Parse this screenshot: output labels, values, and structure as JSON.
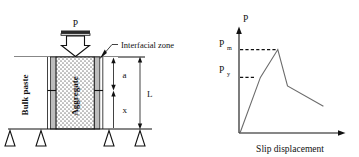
{
  "figure": {
    "panels": [
      "specimen-diagram",
      "load-slip-chart"
    ]
  },
  "specimen": {
    "load_label": "P",
    "callout_label": "Interfacial zone",
    "bulk_paste_label": "Bulk paste",
    "aggregate_label": "Aggregate",
    "dimension_a": "a",
    "dimension_x": "x",
    "dimension_L": "L",
    "support_count": 4,
    "colors": {
      "interfacial_zone_fill": "#b8b8b8",
      "aggregate_fill": "#ffffff",
      "bulk_paste_fill": "#ffffff",
      "outline": "#111111",
      "plate_fill": "#2a2a2a"
    }
  },
  "chart_data": {
    "type": "line",
    "title": "",
    "xlabel": "Slip displacement",
    "ylabel": "P",
    "grid": false,
    "legend": null,
    "xlim": [
      0,
      10
    ],
    "ylim": [
      0,
      10
    ],
    "annotations": [
      {
        "label": "P_m",
        "text": "P",
        "sub": "m",
        "y": 7.8,
        "kind": "peak-load",
        "guide": "dashed"
      },
      {
        "label": "P_y",
        "text": "P",
        "sub": "y",
        "y": 5.2,
        "kind": "yield-load",
        "guide": "dashed"
      }
    ],
    "series": [
      {
        "name": "load-slip curve",
        "color": "#6b6b6b",
        "points": [
          {
            "x": 0.0,
            "y": 0.0
          },
          {
            "x": 2.1,
            "y": 5.2
          },
          {
            "x": 3.9,
            "y": 7.8
          },
          {
            "x": 4.9,
            "y": 4.4
          },
          {
            "x": 8.6,
            "y": 2.5
          }
        ]
      }
    ]
  }
}
